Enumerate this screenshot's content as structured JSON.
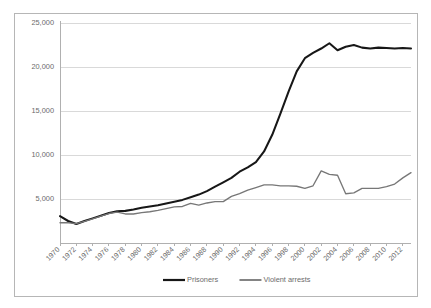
{
  "chart_data": {
    "type": "line",
    "title": "",
    "xlabel": "",
    "ylabel": "",
    "ylim": [
      0,
      25000
    ],
    "xlim": [
      1970,
      2013
    ],
    "grid": true,
    "legend_position": "bottom",
    "ytick_labels": [
      "25,000",
      "20,000",
      "15,000",
      "10,000",
      "5,000"
    ],
    "ytick_values": [
      25000,
      20000,
      15000,
      10000,
      5000
    ],
    "xtick_labels": [
      "1970",
      "1972",
      "1974",
      "1976",
      "1978",
      "1980",
      "1982",
      "1984",
      "1986",
      "1988",
      "1990",
      "1992",
      "1994",
      "1996",
      "1998",
      "2000",
      "2002",
      "2004",
      "2006",
      "2008",
      "2010",
      "2012"
    ],
    "xtick_values": [
      1970,
      1972,
      1974,
      1976,
      1978,
      1980,
      1982,
      1984,
      1986,
      1988,
      1990,
      1992,
      1994,
      1996,
      1998,
      2000,
      2002,
      2004,
      2006,
      2008,
      2010,
      2012
    ],
    "x": [
      1970,
      1971,
      1972,
      1973,
      1974,
      1975,
      1976,
      1977,
      1978,
      1979,
      1980,
      1981,
      1982,
      1983,
      1984,
      1985,
      1986,
      1987,
      1988,
      1989,
      1990,
      1991,
      1992,
      1993,
      1994,
      1995,
      1996,
      1997,
      1998,
      1999,
      2000,
      2001,
      2002,
      2003,
      2004,
      2005,
      2006,
      2007,
      2008,
      2009,
      2010,
      2011,
      2012,
      2013
    ],
    "series": [
      {
        "name": "Prisoners",
        "color": "#171717",
        "values": [
          3050,
          2500,
          2150,
          2500,
          2800,
          3100,
          3400,
          3600,
          3650,
          3800,
          4000,
          4150,
          4300,
          4500,
          4700,
          4900,
          5200,
          5500,
          5900,
          6400,
          6900,
          7400,
          8100,
          8600,
          9200,
          10400,
          12300,
          14700,
          17200,
          19500,
          21000,
          21600,
          22100,
          22700,
          21900,
          22300,
          22500,
          22200,
          22100,
          22200,
          22150,
          22100,
          22150,
          22100
        ]
      },
      {
        "name": "Violent arrests",
        "color": "#777777",
        "values": [
          2300,
          2300,
          2200,
          2450,
          2750,
          3050,
          3350,
          3500,
          3300,
          3300,
          3450,
          3550,
          3700,
          3900,
          4100,
          4150,
          4500,
          4300,
          4550,
          4700,
          4700,
          5300,
          5600,
          6000,
          6300,
          6600,
          6600,
          6500,
          6500,
          6450,
          6200,
          6500,
          8200,
          7800,
          7700,
          5600,
          5700,
          6200,
          6200,
          6200,
          6400,
          6700,
          7400,
          8000
        ]
      }
    ]
  }
}
